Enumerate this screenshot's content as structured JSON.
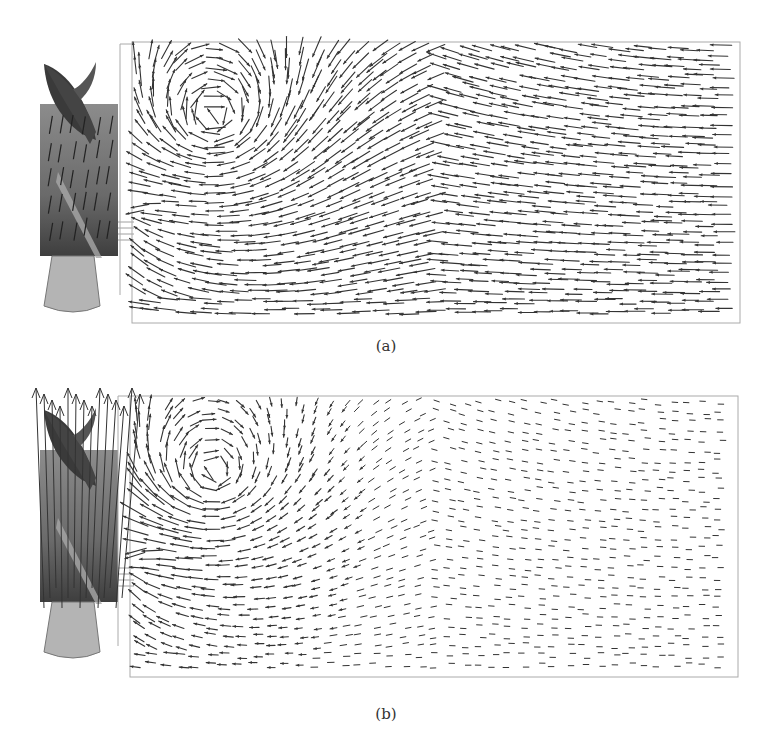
{
  "figure": {
    "panels": [
      {
        "id": "a",
        "caption": "(a)",
        "description": "Velocity vector field, long arrows, whole tank",
        "frame": {
          "x": 132,
          "y": 42,
          "w": 608,
          "h": 281
        },
        "outer_frame": {
          "x": 120,
          "y": 44,
          "h": 251
        },
        "impeller": {
          "x": 38,
          "y": 62
        },
        "arrow_scale": 1.0,
        "vortex": {
          "cx": 215,
          "cy": 115,
          "strength": 1.0
        },
        "uniform_flow": "leftward"
      },
      {
        "id": "b",
        "caption": "(b)",
        "description": "Velocity vector field scaled by magnitude; strong jet near impeller, weak elsewhere",
        "frame": {
          "x": 130,
          "y": 396,
          "w": 608,
          "h": 281
        },
        "outer_frame": {
          "x": 118,
          "y": 396,
          "h": 250
        },
        "impeller": {
          "x": 38,
          "y": 408
        },
        "arrow_scale": 0.45,
        "vortex": {
          "cx": 215,
          "cy": 470,
          "strength": 1.0
        },
        "uniform_flow": "leftward-weak"
      }
    ]
  },
  "colors": {
    "arrow": "#333333",
    "frame": "#aaaaaa",
    "impeller_dark": "#3a3a3a",
    "impeller_mid": "#7a7a7a",
    "impeller_light": "#b4b4b4",
    "background": "#ffffff"
  }
}
